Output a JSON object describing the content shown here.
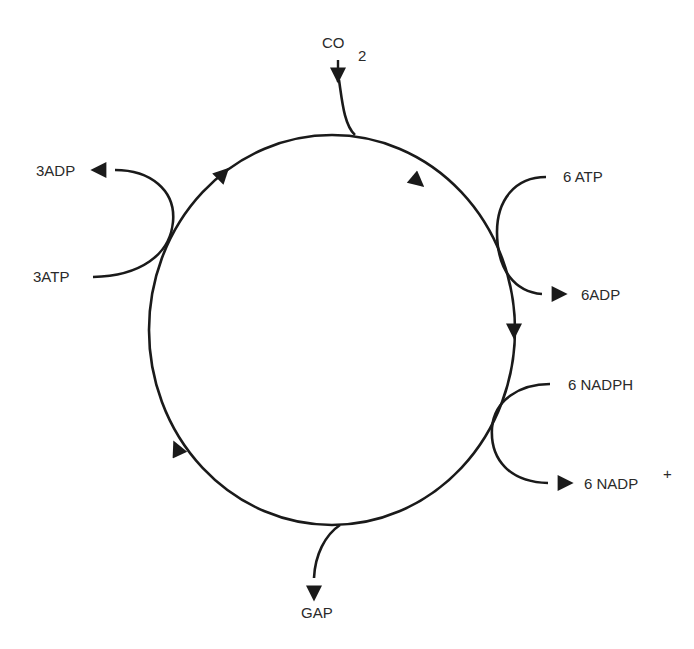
{
  "diagram": {
    "type": "cycle",
    "stroke_color": "#1a1a1a",
    "text_color": "#2a2a2a",
    "direction": "clockwise",
    "inputs": {
      "co2": {
        "label": "CO",
        "subscript": "2"
      },
      "atp_6": {
        "label": "6 ATP"
      },
      "nadph_6": {
        "label": "6 NADPH"
      },
      "atp_3": {
        "label": "3ATP"
      }
    },
    "outputs": {
      "adp_6": {
        "label": "6ADP"
      },
      "nadp_6": {
        "label": "6 NADP",
        "superscript": "+"
      },
      "gap": {
        "label": "GAP"
      },
      "adp_3": {
        "label": "3ADP"
      }
    }
  }
}
